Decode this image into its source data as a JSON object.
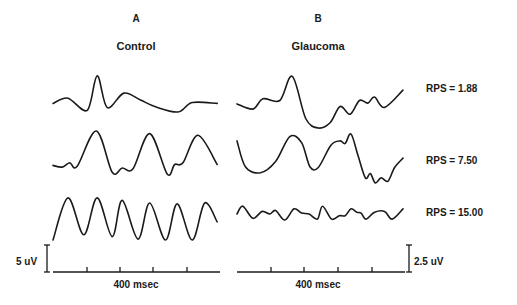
{
  "figure": {
    "panels": [
      {
        "letter": "A",
        "title": "Control"
      },
      {
        "letter": "B",
        "title": "Glaucoma"
      }
    ],
    "rps_labels": [
      "RPS = 1.88",
      "RPS = 7.50",
      "RPS = 15.00"
    ],
    "scale_bars": {
      "left_amplitude": "5 uV",
      "right_amplitude": "2.5 uV",
      "left_time": "400 msec",
      "right_time": "400 msec"
    }
  },
  "chart_data": {
    "type": "line",
    "title": "",
    "xlabel": "400 msec",
    "ylabel": "",
    "note": "Evoked waveform traces; sample values are approximate relative amplitudes traced from the figure (x in msec across a ~2000 msec sweep, y in relative units, 0 = trough of row).",
    "panels": [
      {
        "name": "A Control",
        "amplitude_scale": "5 uV",
        "time_scale": "400 msec",
        "rows": [
          {
            "rps": 1.88,
            "x": [
              0,
              180,
              410,
              530,
              650,
              850,
              1050,
              1230,
              1500,
              1670,
              1970
            ],
            "y": [
              10,
              16,
              2,
              42,
              5,
              22,
              14,
              6,
              0,
              11,
              10
            ]
          },
          {
            "rps": 7.5,
            "x": [
              0,
              110,
              200,
              290,
              520,
              710,
              830,
              960,
              1160,
              1370,
              1460,
              1560,
              1740,
              1970
            ],
            "y": [
              10,
              8,
              13,
              9,
              50,
              2,
              7,
              6,
              47,
              0,
              11,
              13,
              45,
              11
            ]
          },
          {
            "rps": 15.0,
            "x": [
              0,
              180,
              370,
              530,
              710,
              830,
              1020,
              1160,
              1350,
              1490,
              1670,
              1820,
              1970
            ],
            "y": [
              0,
              49,
              6,
              49,
              4,
              46,
              1,
              43,
              0,
              42,
              0,
              43,
              21
            ]
          }
        ]
      },
      {
        "name": "B Glaucoma",
        "amplitude_scale": "2.5 uV",
        "time_scale": "400 msec",
        "rows": [
          {
            "rps": 1.88,
            "x": [
              0,
              190,
              310,
              510,
              660,
              820,
              970,
              1110,
              1230,
              1350,
              1460,
              1560,
              1640,
              1760,
              1980
            ],
            "y": [
              28,
              22,
              34,
              32,
              60,
              11,
              0,
              6,
              25,
              16,
              32,
              29,
              36,
              24,
              44
            ]
          },
          {
            "rps": 7.5,
            "x": [
              0,
              100,
              280,
              460,
              630,
              770,
              870,
              970,
              1120,
              1230,
              1290,
              1360,
              1440,
              1530,
              1590,
              1650,
              1720,
              1800,
              1880,
              1980
            ],
            "y": [
              49,
              19,
              12,
              25,
              54,
              47,
              19,
              18,
              44,
              49,
              46,
              57,
              33,
              6,
              11,
              0,
              6,
              2,
              18,
              29
            ]
          },
          {
            "rps": 15.0,
            "x": [
              0,
              70,
              190,
              300,
              390,
              460,
              570,
              680,
              770,
              860,
              960,
              1020,
              1130,
              1220,
              1290,
              1360,
              1430,
              1480,
              1540,
              1640,
              1760,
              1850,
              1980
            ],
            "y": [
              7,
              16,
              2,
              10,
              7,
              11,
              0,
              13,
              8,
              7,
              1,
              16,
              1,
              5,
              5,
              13,
              9,
              8,
              1,
              9,
              10,
              1,
              13
            ]
          }
        ]
      }
    ]
  }
}
